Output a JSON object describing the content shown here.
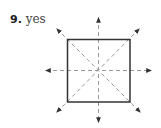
{
  "problem": {
    "number": "9.",
    "answer": "yes"
  },
  "diagram": {
    "shape": "square",
    "square": {
      "x": 67.5,
      "y": 39.5,
      "size": 62.5,
      "stroke": "#333333"
    },
    "center": {
      "x": 98.5,
      "y": 70.5
    },
    "symmetry_lines": [
      {
        "name": "vertical",
        "from": [
          98.5,
          18
        ],
        "to": [
          98.5,
          122
        ]
      },
      {
        "name": "horizontal",
        "from": [
          46,
          70.5
        ],
        "to": [
          151,
          70.5
        ]
      },
      {
        "name": "diagonal-main",
        "from": [
          57,
          29
        ],
        "to": [
          140,
          112
        ]
      },
      {
        "name": "diagonal-anti",
        "from": [
          139,
          29
        ],
        "to": [
          57,
          112
        ]
      }
    ],
    "line_color": "#999999",
    "arrow_color": "#333333"
  }
}
